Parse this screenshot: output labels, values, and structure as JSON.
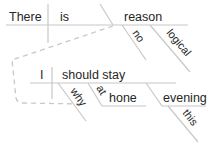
{
  "diagram": {
    "type": "sentence-diagram",
    "colors": {
      "line": "#c8c8c8",
      "text": "#262626",
      "background": "#ffffff"
    },
    "main_clause": {
      "subject": "There",
      "verb": "is",
      "object": "reason",
      "modifiers": [
        "no",
        "logical"
      ]
    },
    "subordinate_clause": {
      "subject": "I",
      "verb": "should stay",
      "modifiers": {
        "why": "why",
        "preposition": "at",
        "prepositional_object": "hone",
        "adverbial_noun": "evening",
        "adverbial_noun_modifier": "this"
      }
    }
  }
}
